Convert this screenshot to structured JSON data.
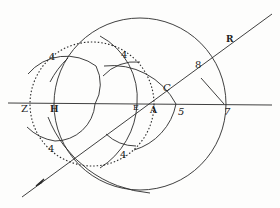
{
  "diagram": {
    "type": "geometric-construction",
    "colors": {
      "ink": "#2a2a2a",
      "paper": "#fdfdfc"
    },
    "labels": {
      "z": "Z",
      "h": "H",
      "e": "E",
      "a": "A",
      "c": "C",
      "five": "5",
      "seven": "7",
      "eight": "8",
      "r": "R",
      "four_top_left": "4",
      "four_top_right": "4",
      "four_bottom_left": "4",
      "four_bottom_right": "4"
    },
    "elements": [
      "horizontal axis line through Z, H, E, A, 5, 7",
      "large solid circle centered near A passing through 7",
      "dotted circle from Z to A",
      "small solid circle around A through C and 5",
      "construction arcs intersecting at the four points labeled 4",
      "oblique ray with arrow passing through E and C toward R",
      "segment from 8 to 7"
    ]
  }
}
